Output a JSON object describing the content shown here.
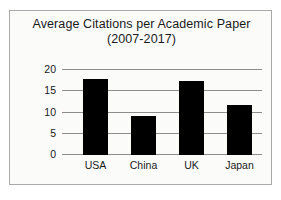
{
  "chart_data": {
    "type": "bar",
    "title": "Average Citations per Academic Paper",
    "subtitle": "(2007-2017)",
    "categories": [
      "USA",
      "China",
      "UK",
      "Japan"
    ],
    "values": [
      18,
      9.2,
      17.5,
      11.7
    ],
    "xlabel": "",
    "ylabel": "",
    "ylim": [
      0,
      20
    ],
    "yticks": [
      0,
      5,
      10,
      15,
      20
    ],
    "ytick_labels": [
      "0",
      "5",
      "10",
      "15",
      "20"
    ],
    "grid": true,
    "legend": false,
    "bar_color": "#000000",
    "gridline_color": "#8d8d8d",
    "frame_color": "#a9a9a9",
    "background_color": "#fbfbfa"
  }
}
